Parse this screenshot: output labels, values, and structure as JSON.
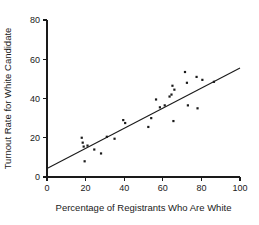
{
  "chart_data": {
    "type": "scatter",
    "title": "",
    "xlabel": "Percentage of Registrants Who Are White",
    "ylabel": "Turnout Rate for White Candidate",
    "xlim": [
      0,
      100
    ],
    "ylim": [
      0,
      80
    ],
    "xticks": [
      0,
      20,
      40,
      60,
      80,
      100
    ],
    "yticks": [
      0,
      20,
      40,
      60,
      80
    ],
    "xtick_labels": [
      "0",
      "20",
      "40",
      "60",
      "80",
      "100"
    ],
    "ytick_labels": [
      "0",
      "20",
      "40",
      "60",
      "80"
    ],
    "grid": false,
    "legend": null,
    "points": [
      {
        "x": 18.0,
        "y": 20.0
      },
      {
        "x": 18.5,
        "y": 17.5
      },
      {
        "x": 19.0,
        "y": 15.5
      },
      {
        "x": 19.5,
        "y": 8.0
      },
      {
        "x": 21.0,
        "y": 16.0
      },
      {
        "x": 24.5,
        "y": 14.0
      },
      {
        "x": 28.0,
        "y": 12.0
      },
      {
        "x": 31.0,
        "y": 20.5
      },
      {
        "x": 35.0,
        "y": 19.5
      },
      {
        "x": 39.5,
        "y": 29.0
      },
      {
        "x": 40.5,
        "y": 27.5
      },
      {
        "x": 52.5,
        "y": 25.5
      },
      {
        "x": 54.0,
        "y": 30.0
      },
      {
        "x": 56.5,
        "y": 39.5
      },
      {
        "x": 58.5,
        "y": 35.5
      },
      {
        "x": 61.0,
        "y": 36.5
      },
      {
        "x": 63.5,
        "y": 41.0
      },
      {
        "x": 64.5,
        "y": 42.0
      },
      {
        "x": 65.0,
        "y": 46.5
      },
      {
        "x": 65.5,
        "y": 28.5
      },
      {
        "x": 66.0,
        "y": 44.5
      },
      {
        "x": 71.5,
        "y": 53.5
      },
      {
        "x": 72.5,
        "y": 48.0
      },
      {
        "x": 73.0,
        "y": 36.5
      },
      {
        "x": 77.5,
        "y": 51.0
      },
      {
        "x": 78.0,
        "y": 35.0
      },
      {
        "x": 80.5,
        "y": 49.5
      },
      {
        "x": 86.5,
        "y": 48.5
      }
    ],
    "fit_line": {
      "x_start": 0,
      "y_start": 4.3,
      "x_end": 100,
      "y_end": 55.5
    },
    "marker_color": "#1a1a1a",
    "line_color": "#1a1a1a"
  }
}
